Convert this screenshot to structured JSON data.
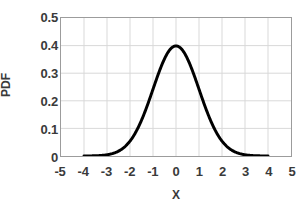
{
  "chart_data": {
    "type": "line",
    "title": "",
    "subtitle": "",
    "xlabel": "X",
    "ylabel": "PDF",
    "xlim": [
      -5,
      5
    ],
    "ylim": [
      0,
      0.5
    ],
    "xticks": [
      "-5",
      "-4",
      "-3",
      "-2",
      "-1",
      "0",
      "1",
      "2",
      "3",
      "4",
      "5"
    ],
    "xtick_values": [
      -5,
      -4,
      -3,
      -2,
      -1,
      0,
      1,
      2,
      3,
      4,
      5
    ],
    "yticks": [
      "0.5",
      "0.4",
      "0.3",
      "0.2",
      "0.1",
      "0"
    ],
    "ytick_values": [
      0.5,
      0.4,
      0.3,
      0.2,
      0.1,
      0
    ],
    "grid": true,
    "grid_color": "#d9d9d9",
    "legend": false,
    "legend_position": "none",
    "annotations": [],
    "series": [
      {
        "name": "Standard normal PDF",
        "color": "#000000",
        "line_width": 3,
        "marker": "dense-dots",
        "distribution": "normal",
        "mean": 0,
        "sigma": 1,
        "peak_value": 0.399,
        "x": [
          -4,
          -3.8,
          -3.6,
          -3.4,
          -3.2,
          -3,
          -2.8,
          -2.6,
          -2.4,
          -2.2,
          -2,
          -1.8,
          -1.6,
          -1.4,
          -1.2,
          -1,
          -0.8,
          -0.6,
          -0.4,
          -0.2,
          0,
          0.2,
          0.4,
          0.6,
          0.8,
          1,
          1.2,
          1.4,
          1.6,
          1.8,
          2,
          2.2,
          2.4,
          2.6,
          2.8,
          3,
          3.2,
          3.4,
          3.6,
          3.8,
          4
        ],
        "values": [
          0.0001,
          0.0003,
          0.0006,
          0.0012,
          0.0024,
          0.0044,
          0.0079,
          0.0136,
          0.0224,
          0.0355,
          0.054,
          0.079,
          0.1109,
          0.1497,
          0.1942,
          0.242,
          0.2897,
          0.3332,
          0.3683,
          0.391,
          0.3989,
          0.391,
          0.3683,
          0.3332,
          0.2897,
          0.242,
          0.1942,
          0.1497,
          0.1109,
          0.079,
          0.054,
          0.0355,
          0.0224,
          0.0136,
          0.0079,
          0.0044,
          0.0024,
          0.0012,
          0.0006,
          0.0003,
          0.0001
        ]
      }
    ]
  },
  "colors": {
    "curve": "#000000",
    "grid": "#d9d9d9",
    "border": "#9c9c9c",
    "text": "#3a3a3a",
    "background": "#ffffff"
  }
}
